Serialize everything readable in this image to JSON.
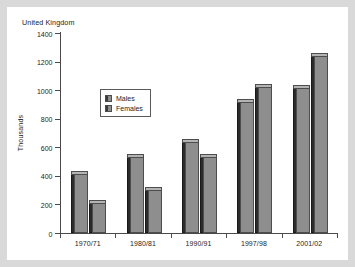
{
  "figure": {
    "title": "United Kingdom",
    "background_color": "#ffffff",
    "page_background_color": "#d9d9d9"
  },
  "chart_data": {
    "type": "bar",
    "title": "United Kingdom",
    "xlabel": "",
    "ylabel": "Thousands",
    "categories": [
      "1970/71",
      "1980/81",
      "1990/91",
      "1997/98",
      "2001/02"
    ],
    "series": [
      {
        "name": "Males",
        "color": "#8e8e8e",
        "values": [
          410,
          530,
          635,
          915,
          1015
        ]
      },
      {
        "name": "Females",
        "color": "#8e8e8e",
        "values": [
          210,
          300,
          530,
          1020,
          1240
        ]
      }
    ],
    "ylim": [
      0,
      1400
    ],
    "ytick_step": 200,
    "yticks": [
      0,
      200,
      400,
      600,
      800,
      1000,
      1200,
      1400
    ],
    "ytick_labels": [
      "0",
      "200",
      "400",
      "600",
      "800",
      "1000",
      "1200",
      "1400"
    ],
    "grid": false,
    "legend_position": "upper-center-left",
    "legend_entries": [
      "Males",
      "Females"
    ],
    "style": "3d-bars"
  },
  "axes": {
    "y_title": "Thousands",
    "axis_color": "#4a4a4a",
    "tick_label_color": "#1d1d1d"
  }
}
